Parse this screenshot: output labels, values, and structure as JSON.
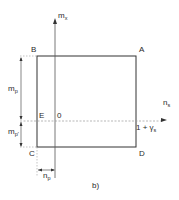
{
  "figure": {
    "caption": "b)",
    "colors": {
      "line": "#333333",
      "dashed": "#9a9a9a",
      "text": "#2a2a2a"
    },
    "corners": {
      "top_left": "B",
      "top_right": "A",
      "bottom_left": "C",
      "bottom_right": "D",
      "left_mid": "E"
    },
    "origin_label": "0",
    "axes": {
      "vertical": {
        "label": "m",
        "subscript": "x"
      },
      "horizontal": {
        "label": "n",
        "subscript": "s"
      }
    },
    "annotations": {
      "right_intercept": "1 + γ",
      "right_intercept_sub": "s"
    },
    "dimensions": {
      "upper_left": {
        "label": "m",
        "subscript": "p"
      },
      "lower_left": {
        "label": "m",
        "subscript": "p'"
      },
      "bottom": {
        "label": "n",
        "subscript": "p"
      }
    }
  }
}
